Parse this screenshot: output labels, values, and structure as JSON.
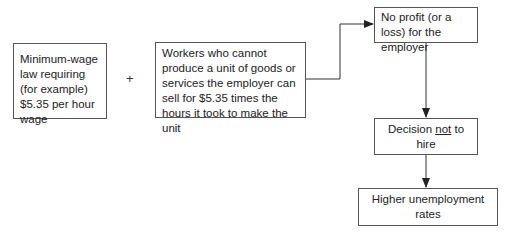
{
  "diagram": {
    "type": "flowchart",
    "nodes": {
      "min_wage": {
        "text": "Minimum-wage law requiring (for example) $5.35 per hour wage"
      },
      "operator": {
        "text": "+"
      },
      "workers": {
        "text": "Workers who cannot produce a unit of goods or services the employer can sell for $5.35 times the hours it took to make the unit"
      },
      "no_profit": {
        "text": "No profit (or a loss) for the employer"
      },
      "decision": {
        "prefix": "Decision ",
        "emphasis": "not",
        "suffix": " to hire"
      },
      "unemployment": {
        "text": "Higher unemployment rates"
      }
    },
    "edges": [
      {
        "from": "workers",
        "to": "no_profit"
      },
      {
        "from": "no_profit",
        "to": "decision"
      },
      {
        "from": "decision",
        "to": "unemployment"
      }
    ],
    "colors": {
      "line": "#333333",
      "border": "#555555",
      "text": "#222222"
    }
  }
}
